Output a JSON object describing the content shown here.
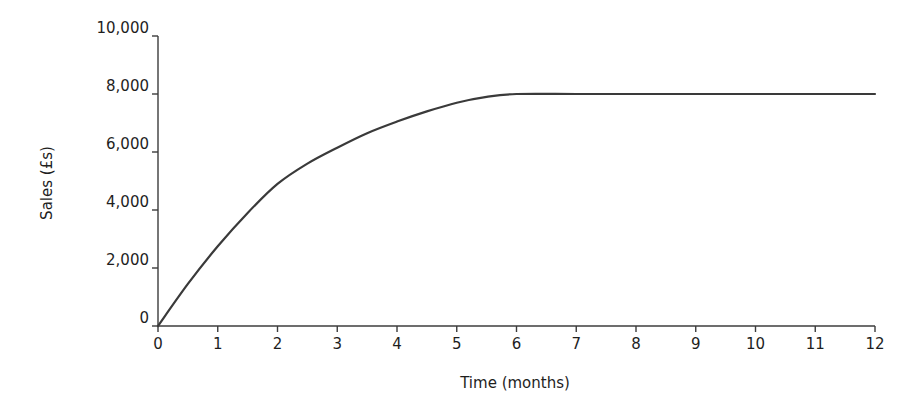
{
  "chart_data": {
    "type": "line",
    "title": "",
    "xlabel": "Time (months)",
    "ylabel": "Sales (£s)",
    "xlim": [
      0,
      12
    ],
    "ylim": [
      0,
      10000
    ],
    "grid": false,
    "legend": null,
    "x_ticks": [
      0,
      1,
      2,
      3,
      4,
      5,
      6,
      7,
      8,
      9,
      10,
      11,
      12
    ],
    "x_tick_labels": [
      "0",
      "1",
      "2",
      "3",
      "4",
      "5",
      "6",
      "7",
      "8",
      "9",
      "10",
      "11",
      "12"
    ],
    "y_ticks": [
      0,
      2000,
      4000,
      6000,
      8000,
      10000
    ],
    "y_tick_labels": [
      "0",
      "2,000",
      "4,000",
      "6,000",
      "8,000",
      "10,000"
    ],
    "series": [
      {
        "name": "Sales",
        "x": [
          0,
          0.5,
          1,
          1.5,
          2,
          2.5,
          3,
          3.5,
          4,
          4.5,
          5,
          5.5,
          6,
          7,
          8,
          9,
          10,
          11,
          12
        ],
        "values": [
          0,
          1450,
          2750,
          3900,
          4900,
          5600,
          6150,
          6650,
          7050,
          7400,
          7700,
          7900,
          8000,
          8000,
          8000,
          8000,
          8000,
          8000,
          8000
        ]
      }
    ]
  },
  "style": {
    "line_color": "#3a3a3a",
    "axis_color": "#3c3c3c",
    "text_color": "#1e1e1e"
  }
}
